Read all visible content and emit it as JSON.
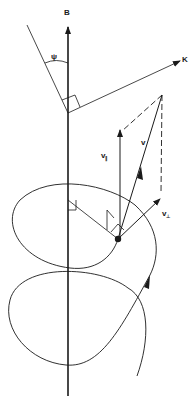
{
  "diagram": {
    "type": "physics-vector-diagram",
    "colors": {
      "ink": "#1a1a1a",
      "background": "#ffffff"
    },
    "labels": {
      "field": "B",
      "wave_vector": "K",
      "angle": "ψ",
      "velocity": "v",
      "v_parallel_main": "v",
      "v_parallel_sub": "∥",
      "v_perp_main": "v",
      "v_perp_sub": "⊥"
    },
    "elements": [
      "magnetic-field-axis",
      "wave-vector-arrow",
      "angle-psi-arc",
      "right-angle-marker-k",
      "velocity-vector",
      "parallel-velocity-component",
      "perpendicular-velocity-component",
      "dashed-construction-lines",
      "particle",
      "helical-trajectory"
    ]
  }
}
